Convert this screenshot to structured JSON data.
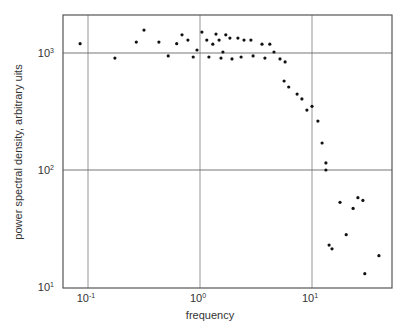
{
  "chart_data": {
    "type": "scatter",
    "title": "",
    "xlabel": "frequency",
    "ylabel": "power spectral density, arbitrary uits",
    "xscale": "log",
    "yscale": "log",
    "xlim": [
      0.06,
      50
    ],
    "ylim": [
      10,
      2300
    ],
    "x_ticks": [
      {
        "value": 0.1,
        "base": "10",
        "exp": "-1"
      },
      {
        "value": 1,
        "base": "10",
        "exp": "0"
      },
      {
        "value": 10,
        "base": "10",
        "exp": "1"
      }
    ],
    "y_ticks": [
      {
        "value": 10,
        "base": "10",
        "exp": "1"
      },
      {
        "value": 100,
        "base": "10",
        "exp": "2"
      },
      {
        "value": 1000,
        "base": "10",
        "exp": "3"
      }
    ],
    "grid": true,
    "legend": null,
    "marker_color": "#111111",
    "grid_color": "#8a8a8a",
    "frame_color": "#555555",
    "series": [
      {
        "name": "psd",
        "points": [
          [
            0.085,
            1200
          ],
          [
            0.174,
            905
          ],
          [
            0.27,
            1240
          ],
          [
            0.316,
            1570
          ],
          [
            0.43,
            1240
          ],
          [
            0.52,
            945
          ],
          [
            0.62,
            1200
          ],
          [
            0.69,
            1430
          ],
          [
            0.78,
            1290
          ],
          [
            0.87,
            925
          ],
          [
            0.94,
            1060
          ],
          [
            1.04,
            1510
          ],
          [
            1.15,
            1290
          ],
          [
            1.2,
            925
          ],
          [
            1.3,
            1190
          ],
          [
            1.39,
            1450
          ],
          [
            1.48,
            1290
          ],
          [
            1.54,
            905
          ],
          [
            1.6,
            1020
          ],
          [
            1.7,
            1430
          ],
          [
            1.85,
            1340
          ],
          [
            1.93,
            890
          ],
          [
            2.18,
            1340
          ],
          [
            2.33,
            925
          ],
          [
            2.47,
            1290
          ],
          [
            2.85,
            1290
          ],
          [
            2.98,
            945
          ],
          [
            3.58,
            1190
          ],
          [
            3.8,
            905
          ],
          [
            4.2,
            1190
          ],
          [
            4.58,
            1020
          ],
          [
            5.18,
            890
          ],
          [
            5.75,
            840
          ],
          [
            5.63,
            576
          ],
          [
            6.2,
            512
          ],
          [
            7.36,
            445
          ],
          [
            8.13,
            405
          ],
          [
            9.0,
            325
          ],
          [
            10.0,
            350
          ],
          [
            11.3,
            262
          ],
          [
            12.3,
            170
          ],
          [
            13.3,
            115
          ],
          [
            13.3,
            100
          ],
          [
            14.2,
            22.8
          ],
          [
            15.1,
            21.2
          ],
          [
            17.8,
            53
          ],
          [
            20.2,
            28
          ],
          [
            23.3,
            47
          ],
          [
            25.7,
            58
          ],
          [
            28.5,
            55
          ],
          [
            29.6,
            13
          ],
          [
            39.6,
            18.5
          ]
        ]
      }
    ]
  },
  "labels": {
    "xlabel": "frequency",
    "ylabel": "power spectral density, arbitrary uits"
  }
}
